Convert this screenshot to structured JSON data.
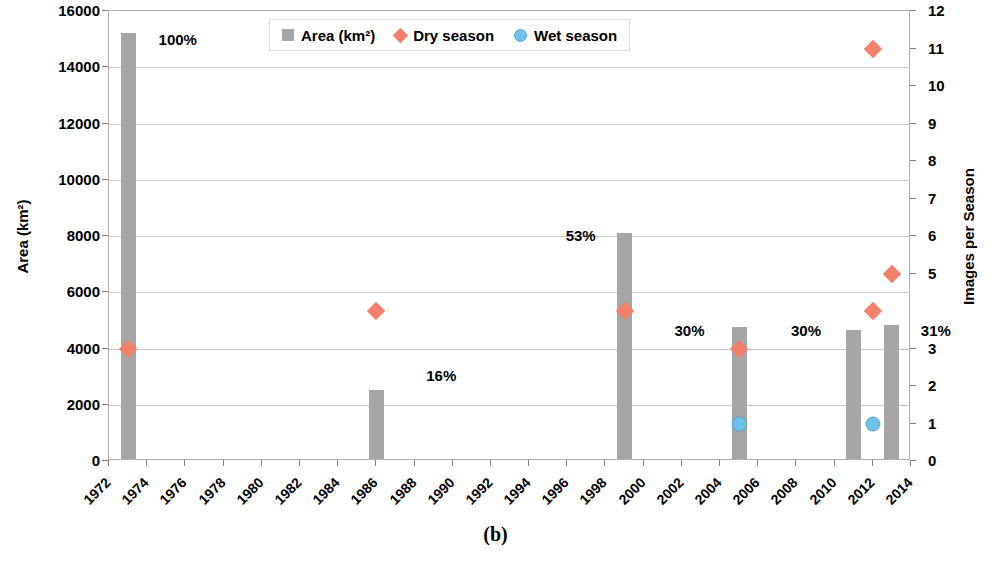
{
  "caption": "(b)",
  "legend": {
    "position": "top-center-inside",
    "items": [
      {
        "label": "Area (km²)",
        "marker": "square-swatch",
        "color": "#a6a6a6"
      },
      {
        "label": "Dry season",
        "marker": "diamond",
        "color": "#f4806a"
      },
      {
        "label": "Wet season",
        "marker": "circle",
        "color": "#6ec1ea"
      }
    ]
  },
  "chart_data": {
    "type": "bar",
    "title": "",
    "subtitle": "",
    "xlabel": "",
    "ylabel": "Area (km²)",
    "y2label": "Images per Season",
    "xlim": [
      1972,
      2014
    ],
    "ylim": [
      0,
      16000
    ],
    "y2lim": [
      0,
      12
    ],
    "grid": true,
    "xticks": [
      1972,
      1974,
      1976,
      1978,
      1980,
      1982,
      1984,
      1986,
      1988,
      1990,
      1992,
      1994,
      1996,
      1998,
      2000,
      2002,
      2004,
      2006,
      2008,
      2010,
      2012,
      2014
    ],
    "yticks": [
      0,
      2000,
      4000,
      6000,
      8000,
      10000,
      12000,
      14000,
      16000
    ],
    "y2ticks": [
      0,
      1,
      2,
      3,
      4,
      5,
      6,
      7,
      8,
      9,
      10,
      11,
      12
    ],
    "series": [
      {
        "name": "Area (km²)",
        "type": "bar",
        "axis": "left",
        "color": "#a6a6a6",
        "points": [
          {
            "x": 1973,
            "value": 15150,
            "label": "100%"
          },
          {
            "x": 1986,
            "value": 2450,
            "label": "16%"
          },
          {
            "x": 1999,
            "value": 8050,
            "label": "53%"
          },
          {
            "x": 2005,
            "value": 4700,
            "label": "30%"
          },
          {
            "x": 2011,
            "value": 4600,
            "label": "30%"
          },
          {
            "x": 2013,
            "value": 4750,
            "label": "31%"
          }
        ]
      },
      {
        "name": "Dry season",
        "type": "scatter",
        "axis": "right",
        "color": "#f4806a",
        "points": [
          {
            "x": 1973,
            "value": 3
          },
          {
            "x": 1986,
            "value": 4
          },
          {
            "x": 1999,
            "value": 4
          },
          {
            "x": 2005,
            "value": 3
          },
          {
            "x": 2012,
            "value": 11
          },
          {
            "x": 2012,
            "value": 4
          },
          {
            "x": 2013,
            "value": 5
          }
        ]
      },
      {
        "name": "Wet season",
        "type": "scatter",
        "axis": "right",
        "color": "#6ec1ea",
        "points": [
          {
            "x": 2005,
            "value": 1
          },
          {
            "x": 2012,
            "value": 1
          }
        ]
      }
    ],
    "bar_labels": [
      {
        "text": "100%",
        "x": 1975.6,
        "y": 15000
      },
      {
        "text": "16%",
        "x": 1989.4,
        "y": 3050
      },
      {
        "text": "53%",
        "x": 1996.7,
        "y": 8050
      },
      {
        "text": "30%",
        "x": 2002.4,
        "y": 4650
      },
      {
        "text": "30%",
        "x": 2008.5,
        "y": 4650
      },
      {
        "text": "31%",
        "x": 2015.3,
        "y": 4650
      }
    ]
  }
}
